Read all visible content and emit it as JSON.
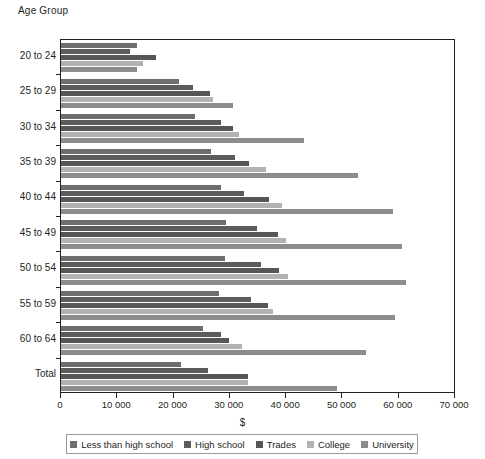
{
  "axis_title_y": "Age Group",
  "axis_title_x": "$",
  "chart_data": {
    "type": "bar",
    "orientation": "horizontal",
    "title": "",
    "xlabel": "$",
    "ylabel": "Age Group",
    "xlim": [
      0,
      70000
    ],
    "xticks": [
      0,
      10000,
      20000,
      30000,
      40000,
      50000,
      60000,
      70000
    ],
    "xtick_labels": [
      "0",
      "10 000",
      "20 000",
      "30 000",
      "40 000",
      "50 000",
      "60 000",
      "70 000"
    ],
    "grid": false,
    "legend_position": "bottom",
    "categories": [
      "20 to 24",
      "25 to 29",
      "30 to 34",
      "35 to 39",
      "40 to 44",
      "45 to 49",
      "50 to 54",
      "55 to 59",
      "60 to 64",
      "Total"
    ],
    "series": [
      {
        "name": "Less than high school",
        "color": "#6e6e6e",
        "values": [
          13500,
          21000,
          23800,
          26600,
          28400,
          29400,
          29100,
          28000,
          25200,
          21300
        ]
      },
      {
        "name": "High school",
        "color": "#5c5c5c",
        "values": [
          12200,
          23400,
          28500,
          31000,
          32600,
          34900,
          35500,
          33700,
          28400,
          26100
        ]
      },
      {
        "name": "Trades",
        "color": "#565656",
        "values": [
          16800,
          26400,
          30500,
          33400,
          36900,
          38500,
          38700,
          36700,
          29800,
          33300
        ]
      },
      {
        "name": "College",
        "color": "#b2b2b2",
        "values": [
          14500,
          27000,
          31700,
          36500,
          39200,
          39900,
          40400,
          37600,
          32100,
          33200
        ]
      },
      {
        "name": "University",
        "color": "#8c8c8c",
        "values": [
          13500,
          30500,
          43100,
          52700,
          58900,
          60600,
          61300,
          59400,
          54100,
          49100
        ]
      }
    ]
  }
}
